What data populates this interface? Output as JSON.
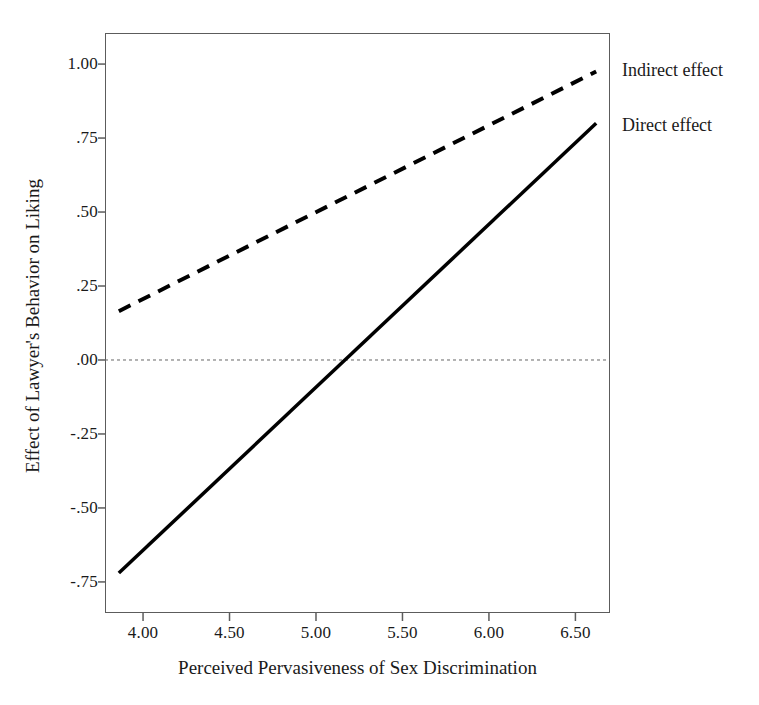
{
  "chart_data": {
    "type": "line",
    "title": "",
    "xlabel": "Perceived Pervasiveness of Sex Discrimination",
    "ylabel": "Effect of Lawyer's Behavior on Liking",
    "xlim": [
      3.78,
      6.7
    ],
    "ylim": [
      -0.855,
      1.105
    ],
    "xticks": [
      "4.00",
      "4.50",
      "5.00",
      "5.50",
      "6.00",
      "6.50"
    ],
    "xtick_values": [
      4.0,
      4.5,
      5.0,
      5.5,
      6.0,
      6.5
    ],
    "yticks": [
      "1.00",
      ".75",
      ".50",
      ".25",
      ".00",
      "-.25",
      "-.50",
      "-.75"
    ],
    "ytick_values": [
      1.0,
      0.75,
      0.5,
      0.25,
      0.0,
      -0.25,
      -0.5,
      -0.75
    ],
    "grid": false,
    "legend_position": "right-inline",
    "reference_line": {
      "name": "zero-line",
      "axis": "y",
      "value": 0.0,
      "style": "dotted",
      "color": "#666666"
    },
    "series": [
      {
        "name": "Indirect effect",
        "style": "dashed",
        "color": "#000000",
        "width": 4,
        "x": [
          3.86,
          6.62
        ],
        "y": [
          0.165,
          0.975
        ],
        "slope": 0.293,
        "intercept": -0.966
      },
      {
        "name": "Direct effect",
        "style": "solid",
        "color": "#000000",
        "width": 3.5,
        "x": [
          3.86,
          6.62
        ],
        "y": [
          -0.72,
          0.8
        ],
        "slope": 0.551,
        "intercept": -2.847,
        "zero_crossing_x": 5.17
      }
    ]
  },
  "annotations": {
    "indirect_label": "Indirect effect",
    "direct_label": "Direct effect"
  },
  "colors": {
    "frame": "#5c5c5c",
    "line": "#000000",
    "reference": "#666666",
    "background": "#ffffff",
    "text": "#1a1a1a"
  }
}
